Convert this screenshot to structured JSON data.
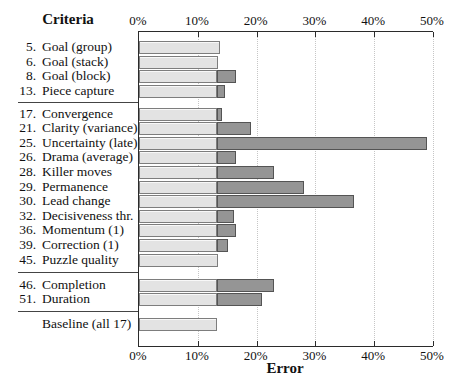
{
  "labels": {
    "header": "Criteria"
  },
  "axis": {
    "xlabel": "Error",
    "tick_labels": [
      "0%",
      "10%",
      "20%",
      "30%",
      "40%",
      "50%"
    ],
    "min_pct": 0,
    "max_pct": 50,
    "tick_step_pct": 10
  },
  "colors": {
    "bar_base_fill": "#e3e3e3",
    "bar_base_border": "#7d7d7d",
    "bar_delta_fill": "#959595",
    "bar_delta_border": "#545454",
    "axis_line": "#2b2b2b",
    "grid_dotted": "#c6c6c6",
    "text": "#111111"
  },
  "chart_data": {
    "type": "bar",
    "orientation": "horizontal",
    "xlabel": "Error",
    "xlim": [
      0,
      50
    ],
    "x_tick_labels": [
      "0%",
      "10%",
      "20%",
      "30%",
      "40%",
      "50%"
    ],
    "grid": "dotted-vertical",
    "segments": [
      "base_pct (light gray)",
      "total_pct (dark gray extension)"
    ],
    "groups": [
      {
        "rows": [
          {
            "num": "5.",
            "label": "Goal (group)",
            "base_pct": 13.7,
            "total_pct": 13.7
          },
          {
            "num": "6.",
            "label": "Goal (stack)",
            "base_pct": 13.4,
            "total_pct": 13.4
          },
          {
            "num": "8.",
            "label": "Goal (block)",
            "base_pct": 13.2,
            "total_pct": 16.5
          },
          {
            "num": "13.",
            "label": "Piece capture",
            "base_pct": 13.2,
            "total_pct": 14.6
          }
        ]
      },
      {
        "rows": [
          {
            "num": "17.",
            "label": "Convergence",
            "base_pct": 13.2,
            "total_pct": 14.1
          },
          {
            "num": "21.",
            "label": "Clarity (variance)",
            "base_pct": 13.2,
            "total_pct": 19.0
          },
          {
            "num": "25.",
            "label": "Uncertainty (late)",
            "base_pct": 13.2,
            "total_pct": 49.0
          },
          {
            "num": "26.",
            "label": "Drama (average)",
            "base_pct": 13.2,
            "total_pct": 16.5
          },
          {
            "num": "28.",
            "label": "Killer moves",
            "base_pct": 13.2,
            "total_pct": 23.0
          },
          {
            "num": "29.",
            "label": "Permanence",
            "base_pct": 13.2,
            "total_pct": 28.0
          },
          {
            "num": "30.",
            "label": "Lead change",
            "base_pct": 13.2,
            "total_pct": 36.6
          },
          {
            "num": "32.",
            "label": "Decisiveness thr.",
            "base_pct": 13.2,
            "total_pct": 16.2
          },
          {
            "num": "36.",
            "label": "Momentum (1)",
            "base_pct": 13.2,
            "total_pct": 16.5
          },
          {
            "num": "39.",
            "label": "Correction (1)",
            "base_pct": 13.2,
            "total_pct": 15.1
          },
          {
            "num": "45.",
            "label": "Puzzle quality",
            "base_pct": 13.4,
            "total_pct": 13.4
          }
        ]
      },
      {
        "rows": [
          {
            "num": "46.",
            "label": "Completion",
            "base_pct": 13.2,
            "total_pct": 23.0
          },
          {
            "num": "51.",
            "label": "Duration",
            "base_pct": 13.2,
            "total_pct": 21.0
          }
        ]
      },
      {
        "rows": [
          {
            "num": "",
            "label": "Baseline (all 17)",
            "base_pct": 13.2,
            "total_pct": 13.2
          }
        ]
      }
    ]
  }
}
